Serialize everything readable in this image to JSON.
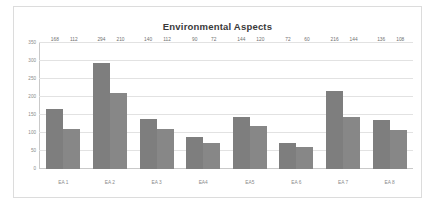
{
  "chart_data": {
    "type": "bar",
    "title": "Environmental Aspects",
    "xlabel": "",
    "ylabel": "",
    "ylim": [
      0,
      350
    ],
    "yticks": [
      0,
      50,
      100,
      150,
      200,
      250,
      300,
      350
    ],
    "grid": true,
    "legend": "none",
    "categories": [
      "EA 1",
      "EA 2",
      "EA 3",
      "EA4",
      "EA5",
      "EA 6",
      "EA 7",
      "EA 8"
    ],
    "series": [
      {
        "name": "Series 1",
        "color": "#7e7e7e",
        "values": [
          168,
          294,
          140,
          90,
          144,
          72,
          216,
          136
        ]
      },
      {
        "name": "Series 2",
        "color": "#878787",
        "values": [
          112,
          210,
          112,
          72,
          120,
          60,
          144,
          108
        ]
      }
    ]
  },
  "colors": {
    "series_1": "#7e7e7e",
    "series_2": "#878787",
    "gridline": "#e2e2e2",
    "axis": "#c9c9c9",
    "title_text": "#3a3a3a",
    "label_text": "#8a8a8a",
    "frame_border": "#dcdcdc",
    "background": "#ffffff"
  }
}
